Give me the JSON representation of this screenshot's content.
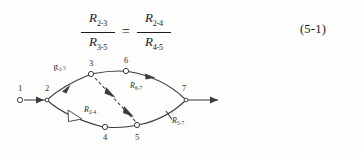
{
  "equation": {
    "left_fraction": {
      "numerator": {
        "symbol": "R",
        "subscript": "2-3"
      },
      "denominator": {
        "symbol": "R",
        "subscript": "3-5"
      }
    },
    "relation": "=",
    "right_fraction": {
      "numerator": {
        "symbol": "R",
        "subscript": "2-4"
      },
      "denominator": {
        "symbol": "R",
        "subscript": "4-5"
      }
    },
    "number": "(5-1)"
  },
  "diagram": {
    "type": "network-flow-graph",
    "nodes": [
      {
        "id": "1",
        "label": "1",
        "x": 20,
        "y": 45,
        "label_x": 20,
        "label_y": 34
      },
      {
        "id": "2",
        "label": "2",
        "x": 47,
        "y": 45,
        "label_x": 47,
        "label_y": 34
      },
      {
        "id": "3",
        "label": "3",
        "x": 91,
        "y": 19,
        "label_x": 91,
        "label_y": 10
      },
      {
        "id": "4",
        "label": "4",
        "x": 105,
        "y": 72,
        "label_x": 105,
        "label_y": 85
      },
      {
        "id": "5",
        "label": "5",
        "x": 137,
        "y": 70,
        "label_x": 137,
        "label_y": 84
      },
      {
        "id": "6",
        "label": "6",
        "x": 126,
        "y": 16,
        "label_x": 126,
        "label_y": 7
      },
      {
        "id": "7",
        "label": "7",
        "x": 186,
        "y": 45,
        "label_x": 184,
        "label_y": 35
      }
    ],
    "edge_labels": [
      {
        "id": "r23",
        "symbol": "R",
        "subscript": "2-3",
        "x": 54,
        "y": 16
      },
      {
        "id": "r24",
        "symbol": "R",
        "subscript": "2-4",
        "x": 84,
        "y": 57
      },
      {
        "id": "r67",
        "symbol": "R",
        "subscript": "6-7",
        "x": 130,
        "y": 33
      },
      {
        "id": "r57",
        "symbol": "R",
        "subscript": "5-7",
        "x": 172,
        "y": 68
      }
    ],
    "colors": {
      "stroke": "#3c3c3c",
      "node_fill": "#ffffff",
      "text": "#2a2a2a",
      "background": "#fdfdfc"
    }
  }
}
